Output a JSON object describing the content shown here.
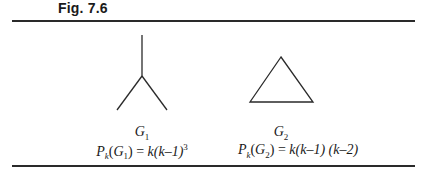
{
  "figure": {
    "label": "Fig. 7.6",
    "graphs": [
      {
        "name": "G1",
        "caption_main": "G",
        "caption_sub": "1",
        "shape": "claw (star with 3 edges)",
        "formula": {
          "lhs_p": "P",
          "lhs_k": "k",
          "lhs_open": "(",
          "lhs_g": "G",
          "lhs_sub": "1",
          "lhs_close": ")",
          "eq": " = ",
          "rhs": "k(k–1)",
          "rhs_sup": "3"
        }
      },
      {
        "name": "G2",
        "caption_main": "G",
        "caption_sub": "2",
        "shape": "triangle",
        "formula": {
          "lhs_p": "P",
          "lhs_k": "k",
          "lhs_open": "(",
          "lhs_g": "G",
          "lhs_sub": "2",
          "lhs_close": ")",
          "eq": " = ",
          "rhs": "k(k–1) (k–2)"
        }
      }
    ]
  }
}
